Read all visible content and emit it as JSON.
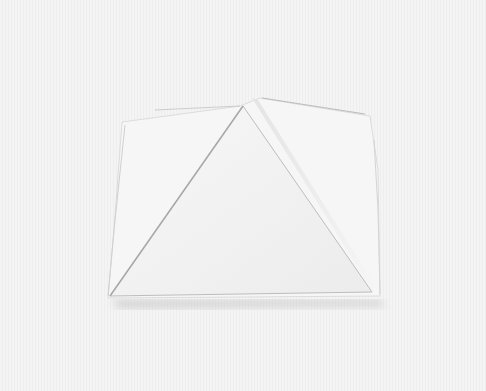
{
  "image": {
    "subject": "folded white paper origami with triangular front flap",
    "colors": {
      "background": "#f3f3f3",
      "paper": "#f7f7f7",
      "flap": "#f0f0f0",
      "shadow": "#cfcfcf",
      "edge": "#d8d8d8"
    }
  }
}
